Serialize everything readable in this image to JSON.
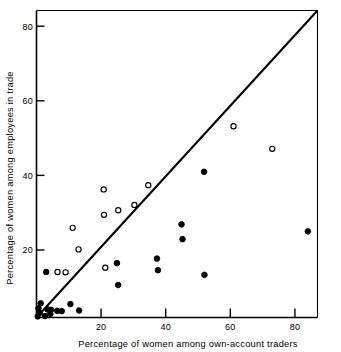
{
  "chart_data": {
    "type": "scatter",
    "title": "",
    "xlabel": "Percentage of women among own-account traders",
    "ylabel": "Percentage of women among employees in trade",
    "xlim": [
      0,
      87
    ],
    "ylim": [
      0,
      87
    ],
    "xticks": [
      20,
      40,
      60,
      80
    ],
    "yticks": [
      20,
      40,
      60,
      80
    ],
    "xtick_labels": [
      "20",
      "40",
      "60",
      "80"
    ],
    "ytick_labels": [
      "20",
      "40",
      "60",
      "80"
    ],
    "grid": false,
    "legend": "none",
    "annotations": [
      {
        "name": "diagonal-reference-line",
        "type": "line",
        "from": [
          0,
          0
        ],
        "to": [
          87,
          87
        ],
        "style": "solid",
        "color": "#000000"
      }
    ],
    "series": [
      {
        "name": "open-circles",
        "marker": "open-circle",
        "color": "#000000",
        "fill": "none",
        "points": [
          [
            6.5,
            12.9
          ],
          [
            9.0,
            12.8
          ],
          [
            11.2,
            25.4
          ],
          [
            13.0,
            19.3
          ],
          [
            20.8,
            36.3
          ],
          [
            20.9,
            29.1
          ],
          [
            21.3,
            14.1
          ],
          [
            25.3,
            30.4
          ],
          [
            30.3,
            31.9
          ],
          [
            34.6,
            37.5
          ],
          [
            61.0,
            54.2
          ],
          [
            73.0,
            47.8
          ]
        ]
      },
      {
        "name": "filled-circles",
        "marker": "filled-circle",
        "color": "#000000",
        "fill": "#000000",
        "points": [
          [
            0.4,
            0.3
          ],
          [
            0.6,
            2.6
          ],
          [
            1.0,
            1.3
          ],
          [
            1.3,
            4.0
          ],
          [
            2.6,
            0.4
          ],
          [
            3.0,
            12.9
          ],
          [
            3.4,
            2.3
          ],
          [
            4.3,
            1.0
          ],
          [
            4.5,
            2.2
          ],
          [
            6.4,
            1.9
          ],
          [
            7.8,
            1.8
          ],
          [
            10.5,
            3.8
          ],
          [
            13.2,
            2.0
          ],
          [
            24.9,
            15.4
          ],
          [
            25.3,
            9.2
          ],
          [
            37.3,
            16.7
          ],
          [
            37.6,
            13.4
          ],
          [
            44.9,
            26.4
          ],
          [
            45.2,
            22.2
          ],
          [
            51.9,
            41.3
          ],
          [
            52.0,
            12.1
          ],
          [
            84.0,
            24.4
          ]
        ]
      }
    ]
  },
  "axes": {
    "x_title": "Percentage of women among own-account traders",
    "y_title": "Percentage of women among employees in trade",
    "x_tick_labels": [
      "20",
      "40",
      "60",
      "80"
    ],
    "y_tick_labels": [
      "20",
      "40",
      "60",
      "80"
    ]
  },
  "colors": {
    "axis": "#000000",
    "marker": "#000000",
    "background": "#ffffff"
  }
}
